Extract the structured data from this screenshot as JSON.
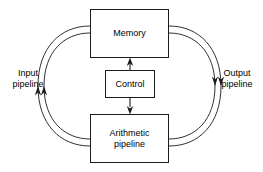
{
  "diagram": {
    "line_color": "#1a1a1a",
    "background_color": "#ffffff",
    "boxes": [
      {
        "id": "memory",
        "label": "Memory"
      },
      {
        "id": "control",
        "label": "Control"
      },
      {
        "id": "arithmetic",
        "label": "Arithmetic\npipeline"
      }
    ],
    "side_labels": [
      {
        "id": "input",
        "label": "Input\npipeline",
        "side": "left"
      },
      {
        "id": "output",
        "label": "Output\npipeline",
        "side": "right"
      }
    ],
    "connections": [
      {
        "id": "control-to-memory",
        "from": "control",
        "to": "memory",
        "direction": "up",
        "style": "straight-arrow"
      },
      {
        "id": "control-to-arithmetic",
        "from": "control",
        "to": "arithmetic",
        "direction": "down",
        "style": "straight-arrow"
      },
      {
        "id": "input-pipeline-outer",
        "from": "memory",
        "to": "arithmetic",
        "direction": "down",
        "style": "curved-arc",
        "side": "left"
      },
      {
        "id": "input-pipeline-inner",
        "from": "memory",
        "to": "arithmetic",
        "direction": "down",
        "style": "curved-arc",
        "side": "left"
      },
      {
        "id": "output-pipeline-outer",
        "from": "arithmetic",
        "to": "memory",
        "direction": "up",
        "style": "curved-arc",
        "side": "right"
      },
      {
        "id": "output-pipeline-inner",
        "from": "arithmetic",
        "to": "memory",
        "direction": "up",
        "style": "curved-arc",
        "side": "right"
      }
    ]
  }
}
